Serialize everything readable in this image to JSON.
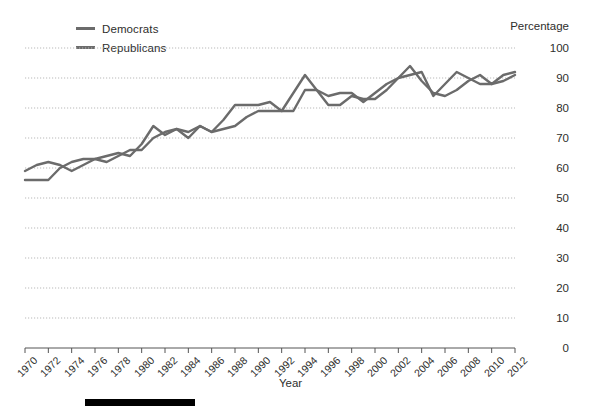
{
  "legend": {
    "items": [
      {
        "label": "Democrats",
        "color": "#6b6b6b"
      },
      {
        "label": "Republicans",
        "color": "#6b6b6b"
      }
    ]
  },
  "axes": {
    "y_title": "Percentage",
    "x_title": "Year"
  },
  "chart_data": {
    "type": "line",
    "title": "",
    "xlabel": "Year",
    "ylabel": "Percentage",
    "xlim": [
      1970,
      2012
    ],
    "ylim": [
      0,
      100
    ],
    "grid": true,
    "legend_position": "top-left",
    "yticks": [
      0,
      10,
      20,
      30,
      40,
      50,
      60,
      70,
      80,
      90,
      100
    ],
    "xticks": [
      1970,
      1972,
      1974,
      1976,
      1978,
      1980,
      1982,
      1984,
      1986,
      1988,
      1990,
      1992,
      1994,
      1996,
      1998,
      2000,
      2002,
      2004,
      2006,
      2008,
      2010,
      2012
    ],
    "x": [
      1970,
      1971,
      1972,
      1973,
      1974,
      1975,
      1976,
      1977,
      1978,
      1979,
      1980,
      1981,
      1982,
      1983,
      1984,
      1985,
      1986,
      1987,
      1988,
      1989,
      1990,
      1991,
      1992,
      1993,
      1994,
      1995,
      1996,
      1997,
      1998,
      1999,
      2000,
      2001,
      2002,
      2003,
      2004,
      2005,
      2006,
      2007,
      2008,
      2009,
      2010,
      2011,
      2012
    ],
    "series": [
      {
        "name": "Democrats",
        "color": "#6b6b6b",
        "values": [
          59,
          61,
          62,
          61,
          59,
          61,
          63,
          64,
          65,
          64,
          68,
          74,
          71,
          73,
          72,
          74,
          72,
          76,
          81,
          81,
          81,
          82,
          79,
          79,
          86,
          86,
          84,
          85,
          85,
          82,
          85,
          88,
          90,
          94,
          89,
          85,
          84,
          86,
          89,
          91,
          88,
          91,
          92
        ]
      },
      {
        "name": "Republicans",
        "color": "#6b6b6b",
        "values": [
          56,
          56,
          56,
          60,
          62,
          63,
          63,
          62,
          64,
          66,
          66,
          70,
          72,
          73,
          70,
          74,
          72,
          73,
          74,
          77,
          79,
          79,
          79,
          85,
          91,
          86,
          81,
          81,
          84,
          83,
          83,
          86,
          90,
          91,
          92,
          84,
          88,
          92,
          90,
          88,
          88,
          89,
          91
        ]
      }
    ]
  },
  "decoration": {
    "bottom_bar_color": "#000000"
  }
}
